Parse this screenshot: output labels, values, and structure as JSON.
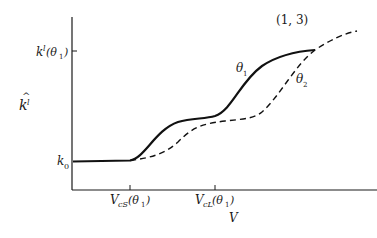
{
  "diagram": {
    "panel_label": "(1, 3)",
    "y_axis": {
      "label_main": "k",
      "label_hat": "^",
      "label_sub": "l",
      "ticks": [
        {
          "main": "k",
          "sub": "l",
          "arg": "(θ",
          "argsub": "1",
          "close": ")"
        },
        {
          "main": "k",
          "sub": "0"
        }
      ]
    },
    "x_axis": {
      "label": "V",
      "ticks": [
        {
          "main": "V",
          "sub": "cS",
          "arg": "(θ",
          "argsub": "1",
          "close": ")"
        },
        {
          "main": "V",
          "sub": "cL",
          "arg": "(θ",
          "argsub": "1",
          "close": ")"
        }
      ]
    },
    "curves": [
      {
        "name": "θ",
        "sub": "1",
        "style": "solid"
      },
      {
        "name": "θ",
        "sub": "2",
        "style": "dashed"
      }
    ]
  }
}
